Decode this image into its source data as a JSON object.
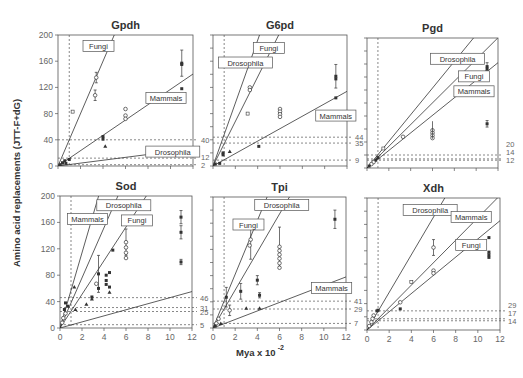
{
  "figure": {
    "ylabel": "Amino acid replacements (JTT-F+dG)",
    "xlabel": "Mya x 10",
    "xlabel_exp": "-2"
  },
  "chart_data": [
    {
      "type": "scatter",
      "title": "Gpdh",
      "frame": {
        "x0": 58,
        "x1": 193,
        "y0": 35,
        "y1": 166
      },
      "xlim": [
        0,
        12
      ],
      "ylim": [
        0,
        200
      ],
      "xticks": [
        0,
        2,
        4,
        6,
        8,
        10,
        12
      ],
      "yticks": [
        0,
        40,
        80,
        120,
        160,
        200
      ],
      "show_xtick_labels": false,
      "show_ytick_labels": true,
      "vline": 1,
      "hlines": [
        40,
        12,
        2
      ],
      "hline_labels": [
        "40",
        "12",
        "2"
      ],
      "lines": [
        {
          "name": "Fungi",
          "slope": 40,
          "label_at": [
            3.6,
            183
          ]
        },
        {
          "name": "Mammals",
          "slope": 11.7,
          "label_at": [
            9.6,
            104
          ]
        },
        {
          "name": "Drosophila",
          "slope": 2.2,
          "label_at": [
            10.2,
            22
          ]
        }
      ],
      "points": [
        {
          "x": 3.4,
          "y": 135,
          "m": "o",
          "err": 8
        },
        {
          "x": 3.3,
          "y": 108,
          "m": "o",
          "err": 8
        },
        {
          "x": 1.3,
          "y": 83,
          "m": "s"
        },
        {
          "x": 6.0,
          "y": 87,
          "m": "o"
        },
        {
          "x": 6.0,
          "y": 77,
          "m": "o"
        },
        {
          "x": 6.0,
          "y": 72,
          "m": "o"
        },
        {
          "x": 4.0,
          "y": 45,
          "m": "f"
        },
        {
          "x": 4.0,
          "y": 41,
          "m": "f"
        },
        {
          "x": 4.2,
          "y": 30,
          "m": "t"
        },
        {
          "x": 11.0,
          "y": 157,
          "m": "f",
          "err": 20
        },
        {
          "x": 11.0,
          "y": 155,
          "m": "f"
        },
        {
          "x": 11.0,
          "y": 118,
          "m": "f"
        },
        {
          "x": 1.0,
          "y": 10,
          "m": "f"
        },
        {
          "x": 0.6,
          "y": 8,
          "m": "f"
        },
        {
          "x": 0.4,
          "y": 5,
          "m": "f"
        },
        {
          "x": 0.2,
          "y": 2,
          "m": "f"
        },
        {
          "x": 0.7,
          "y": 4,
          "m": "f"
        }
      ]
    },
    {
      "type": "scatter",
      "title": "G6pd",
      "frame": {
        "x0": 213,
        "x1": 347,
        "y0": 35,
        "y1": 166
      },
      "xlim": [
        0,
        12
      ],
      "ylim": [
        0,
        200
      ],
      "xticks": [
        0,
        2,
        4,
        6,
        8,
        10,
        12
      ],
      "yticks": [
        0,
        20,
        40,
        60,
        80,
        100,
        120,
        140,
        160,
        180,
        200
      ],
      "show_xtick_labels": false,
      "show_ytick_labels": false,
      "vline": 1,
      "hlines": [
        44,
        35,
        9
      ],
      "hline_labels": [
        "44",
        "35",
        "9"
      ],
      "lines": [
        {
          "name": "Drosophila",
          "slope": 48,
          "label_at": [
            2.9,
            158
          ]
        },
        {
          "name": "Fungi",
          "slope": 34,
          "label_at": [
            5.0,
            180
          ]
        },
        {
          "name": "Mammals",
          "slope": 9.5,
          "label_at": [
            11.0,
            77
          ]
        }
      ],
      "points": [
        {
          "x": 3.3,
          "y": 120,
          "m": "o"
        },
        {
          "x": 3.3,
          "y": 116,
          "m": "o"
        },
        {
          "x": 3.1,
          "y": 80,
          "m": "s"
        },
        {
          "x": 6.0,
          "y": 87,
          "m": "o"
        },
        {
          "x": 6.0,
          "y": 83,
          "m": "o"
        },
        {
          "x": 6.0,
          "y": 79,
          "m": "o"
        },
        {
          "x": 6.0,
          "y": 75,
          "m": "o"
        },
        {
          "x": 11.0,
          "y": 137,
          "m": "f",
          "err": 18
        },
        {
          "x": 11.0,
          "y": 133,
          "m": "f"
        },
        {
          "x": 11.0,
          "y": 104,
          "m": "f"
        },
        {
          "x": 4.1,
          "y": 30,
          "m": "f"
        },
        {
          "x": 1.5,
          "y": 22,
          "m": "t"
        },
        {
          "x": 0.9,
          "y": 20,
          "m": "f"
        },
        {
          "x": 0.9,
          "y": 17,
          "m": "f"
        },
        {
          "x": 0.2,
          "y": 3,
          "m": "f"
        },
        {
          "x": 0.6,
          "y": 4,
          "m": "f"
        }
      ]
    },
    {
      "type": "scatter",
      "title": "Pgd",
      "frame": {
        "x0": 367,
        "x1": 498,
        "y0": 38,
        "y1": 168
      },
      "xlim": [
        0,
        12
      ],
      "ylim": [
        0,
        200
      ],
      "xticks": [
        0,
        2,
        4,
        6,
        8,
        10,
        12
      ],
      "yticks": [
        0,
        20,
        40,
        60,
        80,
        100,
        120,
        140,
        160,
        180,
        200
      ],
      "show_xtick_labels": false,
      "show_ytick_labels": false,
      "vline": 1,
      "hlines": [
        20,
        14,
        12
      ],
      "hline_labels": [
        "20",
        "14",
        "12"
      ],
      "lines": [
        {
          "name": "Drosophila",
          "slope": 20.5,
          "label_at": [
            8.3,
            168
          ]
        },
        {
          "name": "Fungi",
          "slope": 16.7,
          "label_at": [
            9.8,
            141
          ]
        },
        {
          "name": "Mammals",
          "slope": 13.5,
          "label_at": [
            9.8,
            118
          ]
        }
      ],
      "points": [
        {
          "x": 11.0,
          "y": 156,
          "m": "f",
          "err": 6
        },
        {
          "x": 11.0,
          "y": 152,
          "m": "f"
        },
        {
          "x": 11.0,
          "y": 148,
          "m": "f"
        },
        {
          "x": 11.0,
          "y": 68,
          "m": "f",
          "err": 5
        },
        {
          "x": 6.0,
          "y": 58,
          "m": "o"
        },
        {
          "x": 6.0,
          "y": 54,
          "m": "o"
        },
        {
          "x": 6.0,
          "y": 50,
          "m": "o"
        },
        {
          "x": 6.0,
          "y": 46,
          "m": "o"
        },
        {
          "x": 6.0,
          "y": 72,
          "m": "bar"
        },
        {
          "x": 3.3,
          "y": 48,
          "m": "o"
        },
        {
          "x": 1.5,
          "y": 30,
          "m": "s"
        },
        {
          "x": 1.0,
          "y": 16,
          "m": "f"
        },
        {
          "x": 0.8,
          "y": 12,
          "m": "f"
        },
        {
          "x": 0.6,
          "y": 9,
          "m": "o"
        },
        {
          "x": 0.4,
          "y": 6,
          "m": "o"
        },
        {
          "x": 0.2,
          "y": 3,
          "m": "f"
        }
      ]
    },
    {
      "type": "scatter",
      "title": "Sod",
      "frame": {
        "x0": 60,
        "x1": 192,
        "y0": 196,
        "y1": 328
      },
      "xlim": [
        0,
        12
      ],
      "ylim": [
        0,
        200
      ],
      "xticks": [
        0,
        2,
        4,
        6,
        8,
        10,
        12
      ],
      "yticks": [
        0,
        40,
        80,
        120,
        160,
        200
      ],
      "show_xtick_labels": true,
      "show_ytick_labels": true,
      "vline": 1,
      "hlines": [
        46,
        31,
        25,
        5
      ],
      "hline_labels": [
        "46",
        "31",
        "25",
        "5"
      ],
      "lines": [
        {
          "name": "Mammals",
          "slope": 57,
          "label_at": [
            2.5,
            165
          ]
        },
        {
          "name": "Drosophila",
          "slope": 38,
          "label_at": [
            5.8,
            186
          ]
        },
        {
          "name": "Fungi",
          "slope": 25.5,
          "label_at": [
            7.0,
            163
          ]
        },
        {
          "name": "",
          "slope": 4.6,
          "label_at": null
        }
      ],
      "points": [
        {
          "x": 11.0,
          "y": 168,
          "m": "f",
          "err": 10
        },
        {
          "x": 11.0,
          "y": 145,
          "m": "f",
          "err": 10
        },
        {
          "x": 11.0,
          "y": 100,
          "m": "f",
          "err": 4
        },
        {
          "x": 6.0,
          "y": 130,
          "m": "o",
          "err": 20
        },
        {
          "x": 6.0,
          "y": 122,
          "m": "o"
        },
        {
          "x": 6.0,
          "y": 114,
          "m": "o"
        },
        {
          "x": 6.0,
          "y": 106,
          "m": "o"
        },
        {
          "x": 4.8,
          "y": 118,
          "m": "f"
        },
        {
          "x": 3.5,
          "y": 82,
          "m": "f",
          "err": 28
        },
        {
          "x": 3.3,
          "y": 67,
          "m": "o"
        },
        {
          "x": 3.5,
          "y": 60,
          "m": "f"
        },
        {
          "x": 4.2,
          "y": 80,
          "m": "f"
        },
        {
          "x": 4.2,
          "y": 72,
          "m": "f"
        },
        {
          "x": 4.2,
          "y": 66,
          "m": "f"
        },
        {
          "x": 4.5,
          "y": 84,
          "m": "f"
        },
        {
          "x": 4.5,
          "y": 62,
          "m": "f"
        },
        {
          "x": 4.5,
          "y": 54,
          "m": "t"
        },
        {
          "x": 2.9,
          "y": 47,
          "m": "f"
        },
        {
          "x": 2.9,
          "y": 44,
          "m": "t"
        },
        {
          "x": 2.4,
          "y": 36,
          "m": "t"
        },
        {
          "x": 1.3,
          "y": 62,
          "m": "t"
        },
        {
          "x": 0.5,
          "y": 38,
          "m": "f"
        },
        {
          "x": 0.7,
          "y": 33,
          "m": "f"
        },
        {
          "x": 0.4,
          "y": 28,
          "m": "f"
        },
        {
          "x": 0.5,
          "y": 22,
          "m": "o"
        },
        {
          "x": 0.3,
          "y": 15,
          "m": "o"
        },
        {
          "x": 0.2,
          "y": 8,
          "m": "o"
        },
        {
          "x": 1.4,
          "y": 28,
          "m": "t"
        }
      ]
    },
    {
      "type": "scatter",
      "title": "Tpi",
      "frame": {
        "x0": 213,
        "x1": 346,
        "y0": 197,
        "y1": 328
      },
      "xlim": [
        0,
        12
      ],
      "ylim": [
        0,
        200
      ],
      "xticks": [
        0,
        2,
        4,
        6,
        8,
        10,
        12
      ],
      "yticks": [
        0,
        20,
        40,
        60,
        80,
        100,
        120,
        140,
        160,
        180,
        200
      ],
      "show_xtick_labels": true,
      "show_ytick_labels": false,
      "vline": 1,
      "hlines": [
        41,
        29,
        7
      ],
      "hline_labels": [
        "41",
        "29",
        "7"
      ],
      "lines": [
        {
          "name": "Fungi",
          "slope": 41,
          "label_at": [
            3.2,
            158
          ]
        },
        {
          "name": "Drosophila",
          "slope": 29,
          "label_at": [
            6.2,
            188
          ]
        },
        {
          "name": "Mammals",
          "slope": 6.5,
          "label_at": [
            10.7,
            61
          ]
        }
      ],
      "points": [
        {
          "x": 11.0,
          "y": 166,
          "m": "f",
          "err": 14
        },
        {
          "x": 3.4,
          "y": 135,
          "m": "o",
          "err": 30
        },
        {
          "x": 3.3,
          "y": 126,
          "m": "o"
        },
        {
          "x": 6.0,
          "y": 124,
          "m": "o",
          "err": 30
        },
        {
          "x": 6.0,
          "y": 118,
          "m": "o"
        },
        {
          "x": 6.0,
          "y": 112,
          "m": "o"
        },
        {
          "x": 6.0,
          "y": 106,
          "m": "o"
        },
        {
          "x": 6.0,
          "y": 99,
          "m": "o"
        },
        {
          "x": 6.0,
          "y": 92,
          "m": "o"
        },
        {
          "x": 4.0,
          "y": 73,
          "m": "f",
          "err": 7
        },
        {
          "x": 4.2,
          "y": 50,
          "m": "f",
          "err": 4
        },
        {
          "x": 2.5,
          "y": 56,
          "m": "f",
          "err": 12
        },
        {
          "x": 1.2,
          "y": 47,
          "m": "f",
          "err": 15
        },
        {
          "x": 1.5,
          "y": 27,
          "m": "o",
          "err": 8
        },
        {
          "x": 3.0,
          "y": 30,
          "m": "t"
        },
        {
          "x": 4.2,
          "y": 30,
          "m": "t"
        },
        {
          "x": 0.7,
          "y": 7,
          "m": "t"
        },
        {
          "x": 0.5,
          "y": 14,
          "m": "o"
        },
        {
          "x": 0.3,
          "y": 7,
          "m": "o"
        },
        {
          "x": 0.2,
          "y": 3,
          "m": "f"
        }
      ]
    },
    {
      "type": "scatter",
      "title": "Xdh",
      "frame": {
        "x0": 367,
        "x1": 500,
        "y0": 198,
        "y1": 330
      },
      "xlim": [
        0,
        12
      ],
      "ylim": [
        0,
        200
      ],
      "xticks": [
        0,
        2,
        4,
        6,
        8,
        10,
        12
      ],
      "yticks": [
        0,
        20,
        40,
        60,
        80,
        100,
        120,
        140,
        160,
        180,
        200
      ],
      "show_xtick_labels": true,
      "show_ytick_labels": false,
      "vline": 1,
      "hlines": [
        29,
        17,
        14
      ],
      "hline_labels": [
        "29",
        "17",
        "14"
      ],
      "lines": [
        {
          "name": "Drosophila",
          "slope": 28.5,
          "label_at": [
            5.7,
            182
          ]
        },
        {
          "name": "Mammals",
          "slope": 17,
          "label_at": [
            9.4,
            171
          ]
        },
        {
          "name": "Fungi",
          "slope": 13.8,
          "label_at": [
            9.4,
            129
          ]
        }
      ],
      "points": [
        {
          "x": 6.0,
          "y": 125,
          "m": "o",
          "err": 12
        },
        {
          "x": 11.0,
          "y": 140,
          "m": "f"
        },
        {
          "x": 11.0,
          "y": 118,
          "m": "f"
        },
        {
          "x": 11.0,
          "y": 114,
          "m": "f"
        },
        {
          "x": 11.0,
          "y": 110,
          "m": "f"
        },
        {
          "x": 6.0,
          "y": 90,
          "m": "o"
        },
        {
          "x": 6.0,
          "y": 86,
          "m": "o"
        },
        {
          "x": 4.0,
          "y": 73,
          "m": "s"
        },
        {
          "x": 3.0,
          "y": 42,
          "m": "o"
        },
        {
          "x": 3.0,
          "y": 32,
          "m": "f"
        },
        {
          "x": 1.0,
          "y": 30,
          "m": "f"
        },
        {
          "x": 0.9,
          "y": 29,
          "m": "f"
        },
        {
          "x": 0.6,
          "y": 22,
          "m": "o"
        },
        {
          "x": 0.5,
          "y": 17,
          "m": "o"
        },
        {
          "x": 0.4,
          "y": 12,
          "m": "o"
        },
        {
          "x": 0.2,
          "y": 6,
          "m": "o"
        }
      ]
    }
  ]
}
